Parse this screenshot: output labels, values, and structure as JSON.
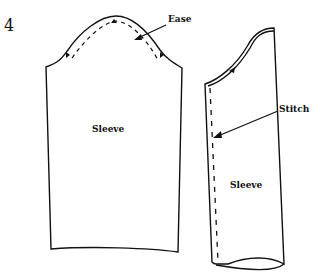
{
  "diagram": {
    "step_number": "4",
    "labels": {
      "ease": "Ease",
      "stitch": "Stitch",
      "sleeve_left": "Sleeve",
      "sleeve_right": "Sleeve"
    },
    "colors": {
      "line": "#111111",
      "background": "#ffffff"
    }
  }
}
